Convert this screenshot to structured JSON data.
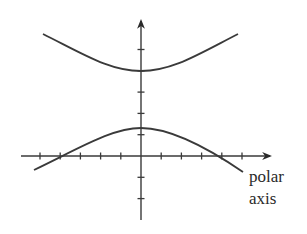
{
  "figure": {
    "type": "polar-hyperbola-graph",
    "axis_label_line1": "polar",
    "axis_label_line2": "axis",
    "colors": {
      "stroke": "#3a3a3a",
      "background": "#ffffff"
    },
    "horizontal_axis": {
      "ticks_left_of_origin": 5,
      "ticks_right_of_origin": 5,
      "arrow": "right"
    },
    "vertical_axis": {
      "ticks_above_origin": 5,
      "ticks_below_origin": 2,
      "arrow": "up"
    },
    "branches": [
      {
        "name": "upper-branch",
        "opens": "up",
        "vertex_units_above_origin": 4
      },
      {
        "name": "lower-branch",
        "opens": "down",
        "vertex_units_above_origin": 1.3,
        "axis_crossings_units": [
          -4,
          4
        ]
      }
    ]
  }
}
